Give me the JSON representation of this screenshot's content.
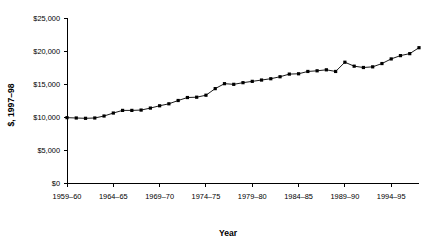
{
  "chart_data": {
    "type": "line",
    "title": "",
    "xlabel": "Year",
    "ylabel": "$, 1997–98",
    "ylim": [
      0,
      25000
    ],
    "ytick_values": [
      0,
      5000,
      10000,
      15000,
      20000,
      25000
    ],
    "ytick_labels": [
      "$0",
      "$5,000",
      "$10,000",
      "$15,000",
      "$20,000",
      "$25,000"
    ],
    "xtick_labels": [
      "1959–60",
      "1964–65",
      "1969–70",
      "1974–75",
      "1979–80",
      "1984–85",
      "1989–90",
      "1994–95"
    ],
    "xtick_indices": [
      0,
      5,
      10,
      15,
      20,
      25,
      30,
      35
    ],
    "grid": false,
    "legend": "none",
    "marker": "filled-square",
    "x": [
      "1959–60",
      "1960–61",
      "1961–62",
      "1962–63",
      "1963–64",
      "1964–65",
      "1965–66",
      "1966–67",
      "1967–68",
      "1968–69",
      "1969–70",
      "1970–71",
      "1971–72",
      "1972–73",
      "1973–74",
      "1974–75",
      "1975–76",
      "1976–77",
      "1977–78",
      "1978–79",
      "1979–80",
      "1980–81",
      "1981–82",
      "1982–83",
      "1983–84",
      "1984–85",
      "1985–86",
      "1986–87",
      "1987–88",
      "1988–89",
      "1989–90",
      "1990–91",
      "1991–92",
      "1992–93",
      "1993–94",
      "1994–95",
      "1995–96",
      "1996–97",
      "1997–98"
    ],
    "values": [
      9900,
      9850,
      9800,
      9850,
      10150,
      10600,
      11000,
      11000,
      11050,
      11350,
      11700,
      12000,
      12500,
      12950,
      13000,
      13300,
      14300,
      15050,
      14950,
      15200,
      15400,
      15600,
      15800,
      16100,
      16500,
      16550,
      16900,
      17000,
      17150,
      16900,
      18300,
      17700,
      17500,
      17600,
      18100,
      18800,
      19300,
      19600,
      20500
    ],
    "series_name": "Expenditure per pupil"
  }
}
